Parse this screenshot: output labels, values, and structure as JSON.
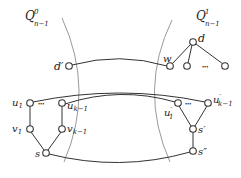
{
  "diagram": {
    "regions": [
      {
        "id": "left",
        "label_base": "Q",
        "label_sup": "0",
        "label_sub": "n−1"
      },
      {
        "id": "right",
        "label_base": "Q",
        "label_sup": "1",
        "label_sub": "n−1"
      }
    ],
    "nodes": {
      "d_prime": {
        "label": "d",
        "prime": "′"
      },
      "w": {
        "label": "w"
      },
      "d": {
        "label": "d"
      },
      "u1": {
        "label": "u",
        "sub": "1"
      },
      "uk1": {
        "label": "u",
        "sub": "k−1"
      },
      "v1": {
        "label": "v",
        "sub": "1"
      },
      "vk1": {
        "label": "v",
        "sub": "k−1"
      },
      "s": {
        "label": "s"
      },
      "u1_prime": {
        "label": "u",
        "prime": "′",
        "sub": "1"
      },
      "uk1_prime": {
        "label": "u",
        "prime": "′",
        "sub": "k−1"
      },
      "s_prime": {
        "label": "s",
        "prime": "′"
      },
      "s_dprime": {
        "label": "s",
        "prime": "″"
      }
    },
    "ellipsis": "•••",
    "edges": [
      [
        "d_prime",
        "w"
      ],
      [
        "d",
        "w"
      ],
      [
        "d",
        "child2"
      ],
      [
        "d",
        "child3"
      ],
      [
        "u1",
        "v1"
      ],
      [
        "v1",
        "s"
      ],
      [
        "uk1",
        "vk1"
      ],
      [
        "vk1",
        "s"
      ],
      [
        "u1",
        "uk1_prime"
      ],
      [
        "uk1",
        "u1_prime"
      ],
      [
        "u1_prime",
        "s_prime"
      ],
      [
        "uk1_prime",
        "s_prime"
      ],
      [
        "s_prime",
        "s_dprime"
      ],
      [
        "s",
        "s_dprime"
      ]
    ]
  }
}
